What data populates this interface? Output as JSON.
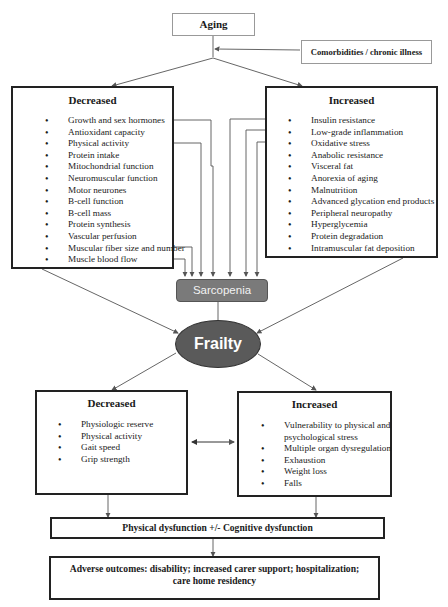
{
  "aging": {
    "label": "Aging"
  },
  "comorbidities": {
    "label": "Comorbidities / chronic illness"
  },
  "upper_decreased": {
    "title": "Decreased",
    "items": [
      "Growth and sex hormones",
      "Antioxidant capacity",
      "Physical activity",
      "Protein intake",
      "Mitochondrial function",
      "Neuromuscular function",
      "Motor neurones",
      "B-cell function",
      "B-cell mass",
      "Protein synthesis",
      "Vascular perfusion",
      "Muscular fiber size and number",
      "Muscle blood flow"
    ]
  },
  "upper_increased": {
    "title": "Increased",
    "items": [
      "Insulin resistance",
      "Low-grade inflammation",
      "Oxidative stress",
      "Anabolic resistance",
      "Visceral fat",
      "Anorexia of aging",
      "Malnutrition",
      "Advanced glycation  end products",
      "Peripheral neuropathy",
      "Hyperglycemia",
      "Protein degradation",
      "Intramuscular fat deposition"
    ]
  },
  "sarcopenia": {
    "label": "Sarcopenia"
  },
  "frailty": {
    "label": "Frailty"
  },
  "lower_decreased": {
    "title": "Decreased",
    "items": [
      "Physiologic reserve",
      "Physical activity",
      "Gait speed",
      "Grip strength"
    ]
  },
  "lower_increased": {
    "title": "Increased",
    "items": [
      "Vulnerability to physical and",
      "psychological stress",
      "Multiple organ dysregulation",
      "Exhaustion",
      "Weight loss",
      "Falls"
    ]
  },
  "dysfunction": {
    "label": "Physical dysfunction +/- Cognitive dysfunction"
  },
  "outcomes": {
    "line1": "Adverse outcomes: disability; increased carer support; hospitalization;",
    "line2": "care home residency"
  },
  "colors": {
    "sarcopenia_fill": "#7a7a7a",
    "frailty_fill": "#5a5a5a",
    "connector": "#888888",
    "border": "#222222"
  }
}
